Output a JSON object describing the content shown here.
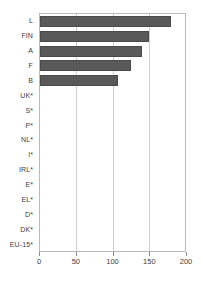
{
  "chart_data": {
    "type": "bar",
    "orientation": "horizontal",
    "title": "",
    "xlabel": "",
    "ylabel": "",
    "xlim": [
      0,
      200
    ],
    "xticks": [
      0,
      50,
      100,
      150,
      200
    ],
    "grid": true,
    "legend": null,
    "categories": [
      "L",
      "FIN",
      "A",
      "F",
      "B",
      "UK*",
      "S*",
      "P*",
      "NL*",
      "I*",
      "IRL*",
      "E*",
      "EL*",
      "D*",
      "DK*",
      "EU-15*"
    ],
    "values": [
      181,
      150,
      141,
      125,
      108,
      0,
      0,
      0,
      0,
      0,
      0,
      0,
      0,
      0,
      0,
      0
    ],
    "bar_color": "#595959",
    "grid_color": "#cfcfcf",
    "axis_color": "#b9b9b9"
  }
}
